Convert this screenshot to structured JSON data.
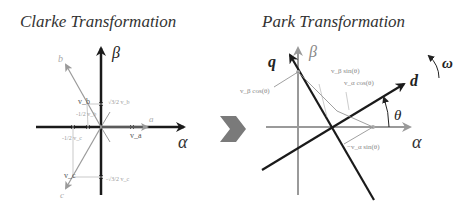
{
  "diagram": {
    "left": {
      "title": "Clarke Transformation",
      "axes": {
        "alpha": "α",
        "beta": "β"
      },
      "phase_labels": {
        "a": "a",
        "b": "b",
        "c": "c"
      },
      "vector_labels": {
        "va": "v_a",
        "vb": "v_b",
        "vc": "v_c",
        "vb_beta": "√3/2 v_b",
        "vb_alpha": "-1/2 v_b",
        "vc_alpha": "-1/2 v_c",
        "vc_beta": "-√3/2 v_c"
      }
    },
    "transition_arrow": "chevron-right",
    "right": {
      "title": "Park Transformation",
      "axes": {
        "alpha": "α",
        "beta": "β",
        "d": "d",
        "q": "q"
      },
      "angle_label": "θ",
      "rotation_label": "ω",
      "projection_labels": {
        "vb_sin": "v_β sin(θ)",
        "va_cos": "v_α cos(θ)",
        "vb_cos": "v_β cos(θ)",
        "neg_va_sin": "−v_α sin(θ)"
      }
    },
    "colors": {
      "primary_axis": "#1a1a1a",
      "secondary_axis": "#9a9a9a",
      "chevron": "#7a7a7a",
      "labels": "#333333",
      "faint_labels": "#8a8a8a"
    }
  }
}
